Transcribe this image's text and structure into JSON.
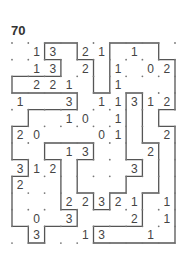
{
  "puzzle": {
    "number": "70",
    "type": "slitherlink",
    "cols": 10,
    "rows": 12,
    "colors": {
      "line": "#555555",
      "dot": "#777777",
      "clue": "#444444",
      "background": "#ffffff"
    },
    "clues": [
      [
        null,
        1,
        3,
        null,
        2,
        1,
        null,
        1,
        null,
        null
      ],
      [
        null,
        1,
        3,
        null,
        2,
        null,
        1,
        null,
        0,
        2
      ],
      [
        null,
        2,
        2,
        1,
        null,
        null,
        1,
        null,
        null,
        null
      ],
      [
        1,
        null,
        null,
        3,
        null,
        1,
        1,
        3,
        1,
        2
      ],
      [
        null,
        null,
        null,
        1,
        0,
        null,
        1,
        null,
        null,
        null
      ],
      [
        2,
        0,
        null,
        null,
        null,
        0,
        1,
        null,
        null,
        2
      ],
      [
        null,
        null,
        null,
        1,
        3,
        null,
        null,
        null,
        2,
        null
      ],
      [
        3,
        1,
        2,
        null,
        null,
        null,
        null,
        3,
        null,
        null
      ],
      [
        2,
        null,
        null,
        null,
        null,
        null,
        null,
        null,
        null,
        null
      ],
      [
        null,
        null,
        null,
        2,
        2,
        3,
        2,
        1,
        null,
        1
      ],
      [
        null,
        0,
        null,
        3,
        null,
        null,
        null,
        2,
        null,
        1
      ],
      [
        null,
        3,
        null,
        null,
        1,
        3,
        null,
        null,
        1,
        null
      ]
    ],
    "solution_loop": [
      [
        2,
        0
      ],
      [
        4,
        0
      ],
      [
        4,
        1
      ],
      [
        5,
        1
      ],
      [
        5,
        3
      ],
      [
        6,
        3
      ],
      [
        6,
        0
      ],
      [
        9,
        0
      ],
      [
        9,
        1
      ],
      [
        10,
        1
      ],
      [
        10,
        4
      ],
      [
        9,
        4
      ],
      [
        9,
        5
      ],
      [
        10,
        5
      ],
      [
        10,
        12
      ],
      [
        5,
        12
      ],
      [
        5,
        11
      ],
      [
        8,
        11
      ],
      [
        8,
        9
      ],
      [
        9,
        9
      ],
      [
        9,
        6
      ],
      [
        8,
        6
      ],
      [
        8,
        3
      ],
      [
        7,
        3
      ],
      [
        7,
        7
      ],
      [
        8,
        7
      ],
      [
        8,
        8
      ],
      [
        7,
        8
      ],
      [
        7,
        9
      ],
      [
        6,
        9
      ],
      [
        6,
        10
      ],
      [
        5,
        10
      ],
      [
        5,
        9
      ],
      [
        4,
        9
      ],
      [
        4,
        7
      ],
      [
        5,
        7
      ],
      [
        5,
        6
      ],
      [
        2,
        6
      ],
      [
        2,
        7
      ],
      [
        3,
        7
      ],
      [
        3,
        10
      ],
      [
        4,
        10
      ],
      [
        4,
        11
      ],
      [
        2,
        11
      ],
      [
        2,
        12
      ],
      [
        1,
        12
      ],
      [
        1,
        11
      ],
      [
        0,
        11
      ],
      [
        0,
        8
      ],
      [
        1,
        8
      ],
      [
        1,
        7
      ],
      [
        0,
        7
      ],
      [
        0,
        5
      ],
      [
        1,
        5
      ],
      [
        1,
        4
      ],
      [
        4,
        4
      ],
      [
        4,
        3
      ],
      [
        0,
        3
      ],
      [
        0,
        2
      ],
      [
        3,
        2
      ],
      [
        3,
        1
      ],
      [
        2,
        1
      ],
      [
        2,
        0
      ]
    ]
  }
}
